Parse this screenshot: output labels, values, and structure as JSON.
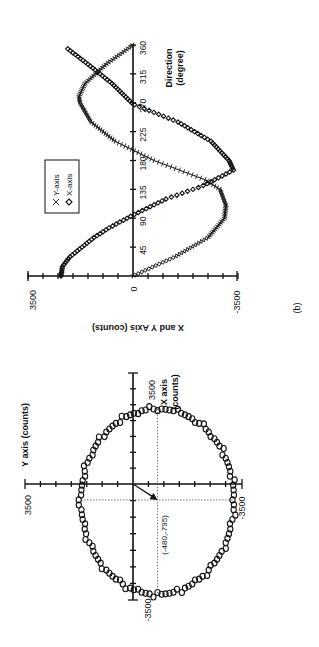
{
  "figure_labels": {
    "panel_b": "(b)"
  },
  "chart_data": [
    {
      "id": "a",
      "type": "scatter",
      "title": "",
      "xlabel": "X axis (counts)",
      "ylabel": "Y axis (counts)",
      "xlim": [
        -3500,
        3500
      ],
      "ylim": [
        -3500,
        3500
      ],
      "tick_labels": {
        "x_pos": "3500",
        "x_neg": "-3500",
        "y_pos": "3500",
        "y_neg": "-3500"
      },
      "grid": false,
      "shape": "ellipse",
      "ellipse": {
        "center_x": -480,
        "center_y": -795,
        "x_radius": 2850,
        "y_radius": 2480
      },
      "annotation": {
        "text": "(-480,-795)",
        "x": -480,
        "y": -795,
        "arrow_from_origin": true
      },
      "point_count": 120,
      "rotation": "figure rotated 90 degrees counter-clockwise on page"
    },
    {
      "id": "b",
      "type": "scatter",
      "title": "",
      "xlabel": "Direction (degree)",
      "ylabel": "X and Y Axis (counts)",
      "xlim": [
        0,
        360
      ],
      "ylim": [
        -3500,
        3500
      ],
      "x_ticks": [
        45,
        90,
        135,
        180,
        225,
        270,
        315,
        360
      ],
      "y_tick_labels": [
        "3500",
        "0",
        "-3500"
      ],
      "grid": false,
      "legend": {
        "position": "upper-left (rotated)",
        "entries": [
          "Y-axis",
          "X-axis"
        ]
      },
      "series": [
        {
          "name": "Y-axis",
          "marker": "x",
          "x": [
            0,
            30,
            60,
            90,
            110,
            135,
            150,
            180,
            210,
            240,
            270,
            280,
            300,
            330,
            360
          ],
          "values": [
            0,
            -1400,
            -2500,
            -3050,
            -3100,
            -2900,
            -2400,
            -700,
            600,
            1400,
            1770,
            1800,
            1600,
            900,
            0
          ]
        },
        {
          "name": "X-axis",
          "marker": "diamond",
          "x": [
            0,
            15,
            30,
            45,
            60,
            75,
            95,
            120,
            140,
            165,
            180,
            210,
            240,
            268,
            300,
            330,
            355
          ],
          "values": [
            2400,
            2350,
            2100,
            1700,
            1300,
            800,
            0,
            -1100,
            -2300,
            -3350,
            -3200,
            -2600,
            -1500,
            0,
            700,
            1500,
            2200
          ]
        }
      ],
      "rotation": "figure rotated 90 degrees counter-clockwise on page"
    }
  ]
}
